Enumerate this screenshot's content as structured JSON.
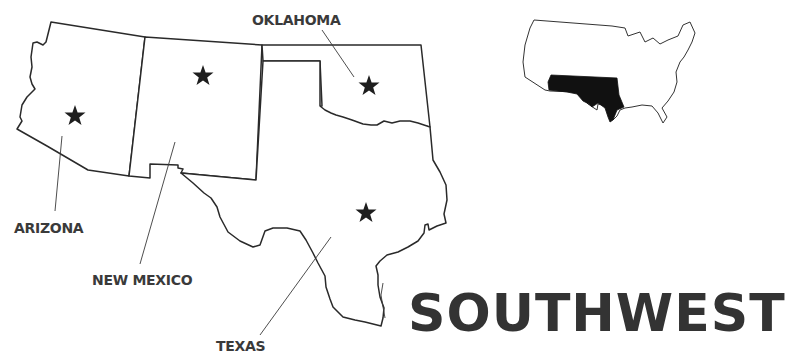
{
  "title": "SOUTHWEST",
  "states": [
    {
      "name": "ARIZONA",
      "has_capital_star": true
    },
    {
      "name": "NEW MEXICO",
      "has_capital_star": true
    },
    {
      "name": "OKLAHOMA",
      "has_capital_star": true
    },
    {
      "name": "TEXAS",
      "has_capital_star": true
    }
  ],
  "labels": {
    "arizona": "ARIZONA",
    "new_mexico": "NEW MEXICO",
    "oklahoma": "OKLAHOMA",
    "texas": "TEXAS"
  },
  "inset": {
    "description": "United States locator map with Southwest region highlighted",
    "highlight_color": "#111111"
  },
  "colors": {
    "outline": "#2a2a2a",
    "star": "#1e1e1e",
    "text": "#3a3a3a",
    "background": "#ffffff"
  }
}
